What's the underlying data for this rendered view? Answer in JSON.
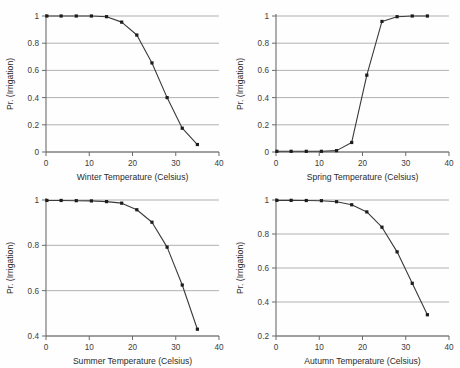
{
  "figure": {
    "background_color": "#fefefe",
    "line_color": "#3a3a3a",
    "marker_color": "#1c1c1c",
    "grid_color": "#a8a8a8",
    "axis_color": "#6b6b6b",
    "panel_count": 4,
    "layout": "2x2"
  },
  "chart_data": [
    {
      "type": "line",
      "title": "",
      "xlabel": "Winter Temperature (Celsius)",
      "ylabel": "Pr. (Irrigation)",
      "xlim": [
        0,
        40
      ],
      "ylim": [
        0,
        1
      ],
      "xticks": [
        0,
        10,
        20,
        30,
        40
      ],
      "xticklabels": [
        "0",
        "10",
        "20",
        "30",
        "40"
      ],
      "yticks": [
        0,
        0.2,
        0.4,
        0.6,
        0.8,
        1
      ],
      "yticklabels": [
        "0",
        "0.2",
        "0.4",
        "0.6",
        "0.8",
        "1"
      ],
      "grid": true,
      "legend": "none",
      "marker": "square",
      "x": [
        0.2,
        3.5,
        7.0,
        10.5,
        14.0,
        17.5,
        21.0,
        24.5,
        28.0,
        31.5,
        35.0
      ],
      "y": [
        1.0,
        1.0,
        1.0,
        1.0,
        0.995,
        0.955,
        0.86,
        0.655,
        0.4,
        0.175,
        0.055
      ]
    },
    {
      "type": "line",
      "title": "",
      "xlabel": "Spring Temperature (Celsius)",
      "ylabel": "Pr. (Irrigation)",
      "xlim": [
        0,
        40
      ],
      "ylim": [
        0,
        1
      ],
      "xticks": [
        0,
        10,
        20,
        30,
        40
      ],
      "xticklabels": [
        "0",
        "10",
        "20",
        "30",
        "40"
      ],
      "yticks": [
        0,
        0.2,
        0.4,
        0.6,
        0.8,
        1
      ],
      "yticklabels": [
        "0",
        "0.2",
        "0.4",
        "0.6",
        "0.8",
        "1"
      ],
      "grid": true,
      "legend": "none",
      "marker": "square",
      "x": [
        0.2,
        3.5,
        7.0,
        10.5,
        14.0,
        17.5,
        21.0,
        24.5,
        28.0,
        31.5,
        35.0
      ],
      "y": [
        0.005,
        0.005,
        0.005,
        0.005,
        0.01,
        0.07,
        0.565,
        0.96,
        0.995,
        1.0,
        1.0
      ]
    },
    {
      "type": "line",
      "title": "",
      "xlabel": "Summer Temperature (Celsius)",
      "ylabel": "Pr. (Irrigation)",
      "xlim": [
        0,
        40
      ],
      "ylim": [
        0.4,
        1
      ],
      "xticks": [
        0,
        10,
        20,
        30,
        40
      ],
      "xticklabels": [
        "0",
        "10",
        "20",
        "30",
        "40"
      ],
      "yticks": [
        0.4,
        0.6,
        0.8,
        1
      ],
      "yticklabels": [
        "0.4",
        "0.6",
        "0.8",
        "1"
      ],
      "grid": true,
      "legend": "none",
      "marker": "square",
      "x": [
        0.2,
        3.5,
        7.0,
        10.5,
        14.0,
        17.5,
        21.0,
        24.5,
        28.0,
        31.5,
        35.0
      ],
      "y": [
        0.998,
        0.998,
        0.997,
        0.996,
        0.993,
        0.986,
        0.957,
        0.902,
        0.792,
        0.625,
        0.43
      ]
    },
    {
      "type": "line",
      "title": "",
      "xlabel": "Autumn Temperature (Celsius)",
      "ylabel": "Pr. (Irrigation)",
      "xlim": [
        0,
        40
      ],
      "ylim": [
        0.2,
        1
      ],
      "xticks": [
        0,
        10,
        20,
        30,
        40
      ],
      "xticklabels": [
        "0",
        "10",
        "20",
        "30",
        "40"
      ],
      "yticks": [
        0.2,
        0.4,
        0.6,
        0.8,
        1
      ],
      "yticklabels": [
        "0.2",
        "0.4",
        "0.6",
        "0.8",
        "1"
      ],
      "grid": true,
      "legend": "none",
      "marker": "square",
      "x": [
        0.2,
        3.5,
        7.0,
        10.5,
        14.0,
        17.5,
        21.0,
        24.5,
        28.0,
        31.5,
        35.0
      ],
      "y": [
        0.998,
        0.998,
        0.997,
        0.996,
        0.99,
        0.972,
        0.93,
        0.84,
        0.695,
        0.51,
        0.325
      ]
    }
  ]
}
